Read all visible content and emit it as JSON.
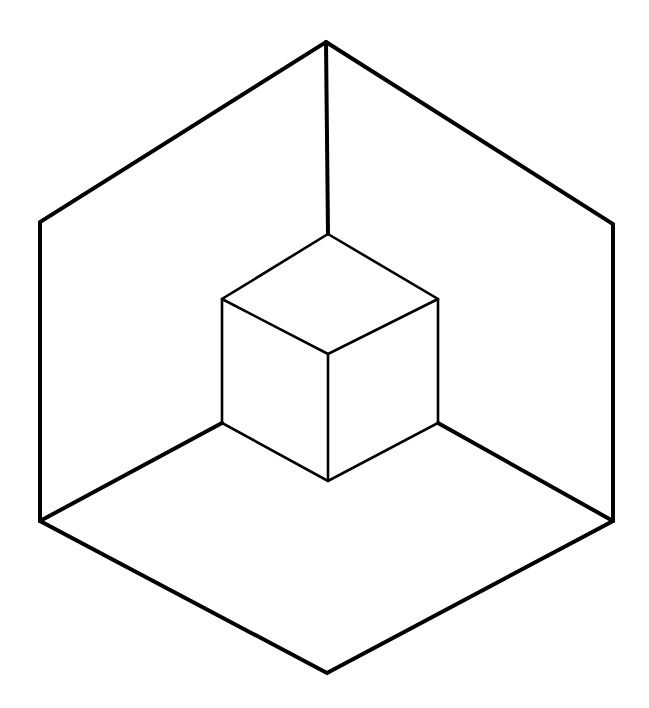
{
  "figure": {
    "stroke_color": "#000000",
    "background": "#ffffff",
    "outer_hexagon": [
      [
        326,
        42
      ],
      [
        613,
        224
      ],
      [
        613,
        521
      ],
      [
        327,
        673
      ],
      [
        40,
        521
      ],
      [
        40,
        222
      ]
    ],
    "outer_edges_to_inner": [
      [
        [
          326,
          42
        ],
        [
          328,
          234
        ]
      ],
      [
        [
          40,
          521
        ],
        [
          222,
          423
        ]
      ],
      [
        [
          613,
          521
        ],
        [
          438,
          423
        ]
      ]
    ],
    "inner_cube": {
      "top": [
        328,
        234
      ],
      "left_top": [
        222,
        299
      ],
      "right_top": [
        438,
        299
      ],
      "center": [
        328,
        354
      ],
      "left_bottom": [
        222,
        423
      ],
      "right_bottom": [
        438,
        423
      ],
      "bottom": [
        328,
        481
      ]
    }
  }
}
